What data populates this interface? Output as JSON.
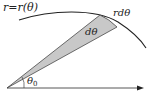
{
  "diagram": {
    "labels": {
      "curve": "r=r(θ)",
      "arc": "rdθ",
      "wedge_angle": "dθ",
      "base_angle": "θ",
      "base_angle_sub": "0"
    },
    "colors": {
      "line": "#222222",
      "wedge_fill": "#c8c8c8",
      "axis": "#444444"
    }
  }
}
